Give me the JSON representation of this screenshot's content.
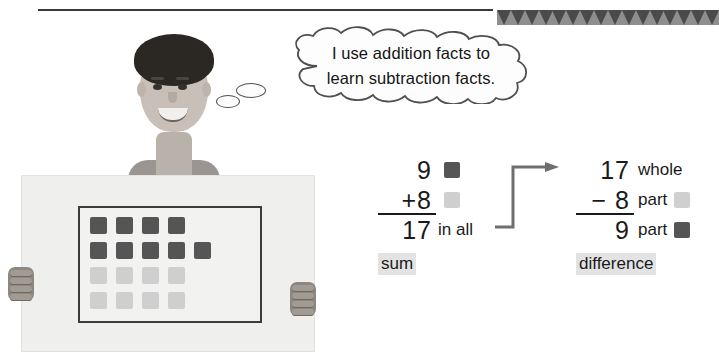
{
  "speech": {
    "line1": "I use addition facts to",
    "line2": "learn subtraction facts."
  },
  "poster": {
    "description": "Boy holding poster with counters",
    "counter_rows": [
      [
        "dark",
        "dark",
        "dark",
        "dark"
      ],
      [
        "dark",
        "dark",
        "dark",
        "dark",
        "dark"
      ],
      [
        "light",
        "light",
        "light",
        "light"
      ],
      [
        "light",
        "light",
        "light",
        "light"
      ]
    ],
    "dark_count": 9,
    "light_count": 8,
    "total_count": 17
  },
  "addition": {
    "addend1": "9",
    "operator": "+",
    "addend2": "8",
    "total": "17",
    "total_word": "in all",
    "label": "sum",
    "chip1_color": "#555555",
    "chip2_color": "#cfcfcf"
  },
  "subtraction": {
    "whole": "17",
    "whole_word": "whole",
    "operator": "−",
    "part1": "8",
    "part1_word": "part",
    "part2": "9",
    "part2_word": "part",
    "label": "difference",
    "chip1_color": "#cfcfcf",
    "chip2_color": "#555555"
  },
  "colors": {
    "dark_counter": "#555555",
    "light_counter": "#cfcfcf",
    "highlight": "#e3e3e3",
    "ink": "#1a1a1a",
    "banner": "#8e8e8e",
    "banner_tooth": "#4a4a4a"
  }
}
